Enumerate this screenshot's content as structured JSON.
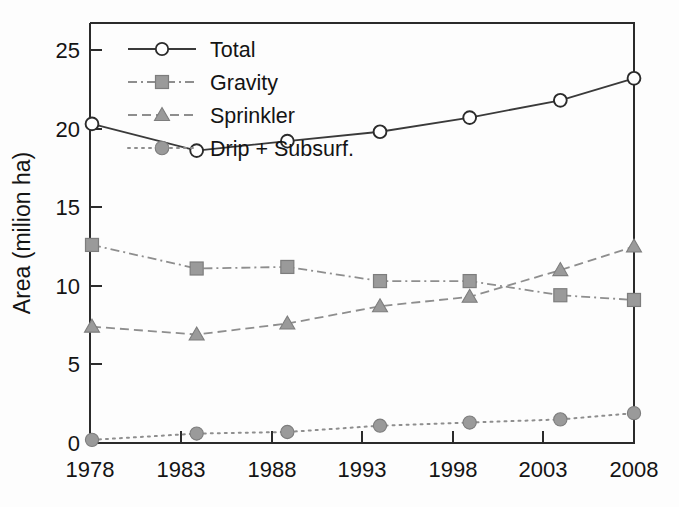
{
  "figure": {
    "background_color": "#fdfdfd",
    "frame_color": "#2b2b2b",
    "text_color": "#141414"
  },
  "chart_data": {
    "type": "line",
    "title": "",
    "subtitle": "",
    "xlabel": "",
    "ylabel": "Area (milion ha)",
    "x": [
      1978,
      1983,
      1988,
      1993,
      1998,
      2003,
      2008
    ],
    "categories": [
      "1978",
      "1983",
      "1988",
      "1993",
      "1998",
      "2003",
      "2008"
    ],
    "xtick_labels": [
      "1978",
      "1983",
      "1988",
      "1993",
      "1998",
      "2003",
      "2008"
    ],
    "ytick_labels": [
      "0",
      "5",
      "10",
      "15",
      "20",
      "25"
    ],
    "ytick_values": [
      0,
      5,
      10,
      15,
      20,
      25
    ],
    "xlim": [
      1978,
      2008
    ],
    "ylim": [
      0,
      26.5
    ],
    "grid": false,
    "legend_position": "upper left inside",
    "series": [
      {
        "name": "Total",
        "values": [
          20.3,
          18.6,
          19.2,
          19.8,
          20.7,
          21.8,
          23.2
        ],
        "color": "#3a3a3a",
        "marker": "open-circle",
        "line_style": "solid"
      },
      {
        "name": "Gravity",
        "values": [
          12.6,
          11.1,
          11.2,
          10.3,
          10.3,
          9.4,
          9.1
        ],
        "color": "#8e8e8e",
        "marker": "filled-square",
        "line_style": "dash-dot"
      },
      {
        "name": "Sprinkler",
        "values": [
          7.4,
          6.9,
          7.6,
          8.7,
          9.3,
          11.0,
          12.5
        ],
        "color": "#8e8e8e",
        "marker": "filled-triangle",
        "line_style": "dashed"
      },
      {
        "name": "Drip + Subsurf.",
        "values": [
          0.2,
          0.6,
          0.7,
          1.1,
          1.3,
          1.5,
          1.9
        ],
        "color": "#8e8e8e",
        "marker": "filled-circle",
        "line_style": "dotted"
      }
    ]
  },
  "legend": {
    "entries": [
      {
        "label": "Total"
      },
      {
        "label": "Gravity"
      },
      {
        "label": "Sprinkler"
      },
      {
        "label": "Drip + Subsurf."
      }
    ]
  }
}
